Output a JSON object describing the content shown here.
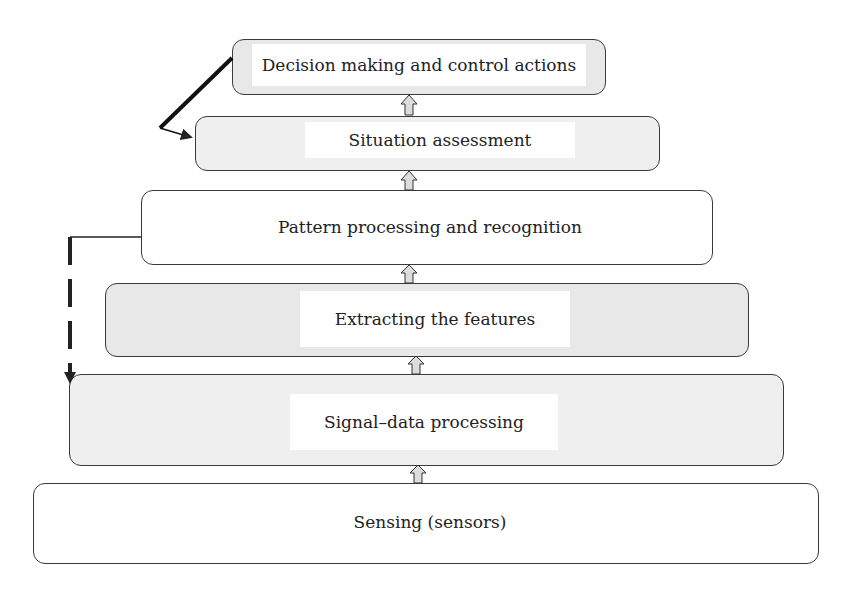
{
  "diagram": {
    "type": "layered-hierarchy",
    "layers": [
      {
        "id": "decision",
        "label": "Decision making and control actions",
        "fill": "#e8e8e8"
      },
      {
        "id": "situation",
        "label": "Situation assessment",
        "fill": "#eeeeee"
      },
      {
        "id": "pattern",
        "label": "Pattern processing and recognition",
        "fill": "#ffffff"
      },
      {
        "id": "features",
        "label": "Extracting the features",
        "fill": "#e4e4e4"
      },
      {
        "id": "signal",
        "label": "Signal–data processing",
        "fill": "#efefef"
      },
      {
        "id": "sensing",
        "label": "Sensing (sensors)",
        "fill": "#ffffff"
      }
    ],
    "flows": [
      {
        "from": "sensing",
        "to": "signal",
        "style": "hollow-up-arrow"
      },
      {
        "from": "signal",
        "to": "features",
        "style": "hollow-up-arrow"
      },
      {
        "from": "features",
        "to": "pattern",
        "style": "hollow-up-arrow"
      },
      {
        "from": "pattern",
        "to": "situation",
        "style": "hollow-up-arrow"
      },
      {
        "from": "situation",
        "to": "decision",
        "style": "hollow-up-arrow"
      },
      {
        "from": "decision",
        "to": "situation",
        "style": "bold-feedback-arrow"
      },
      {
        "from": "pattern",
        "to": "signal",
        "style": "dashed-feedback-arrow"
      }
    ]
  }
}
